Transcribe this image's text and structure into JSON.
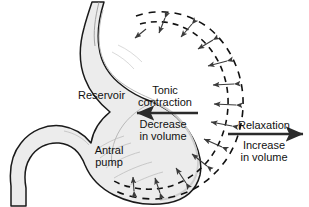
{
  "figure": {
    "background_color": "#ffffff",
    "wall_fill_color": "#ececec",
    "wall_stroke_color": "#1a1a1a",
    "dashed_stroke_color": "#111111",
    "arrow_color": "#3a3a3a",
    "bold_arrow_color": "#303030"
  },
  "labels": {
    "reservoir": "Reservoir",
    "tonic_contraction_line1": "Tonic",
    "tonic_contraction_line2": "contraction",
    "decrease_line1": "Decrease",
    "decrease_line2": "in volume",
    "antral_line1": "Antral",
    "antral_line2": "pump",
    "relaxation": "Relaxation",
    "increase_line1": "Increase",
    "increase_line2": "in volume"
  },
  "annotations": {
    "contraction_arrow_direction": "left",
    "relaxation_arrow_direction": "right",
    "radial_arrows_count": 13,
    "dashed_outline_count": 2
  }
}
